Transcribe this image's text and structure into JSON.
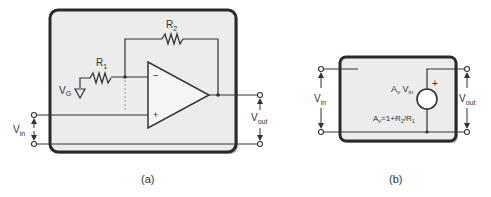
{
  "diagram_a": {
    "caption": "(a)",
    "labels": {
      "r1": "R",
      "r1_sub": "1",
      "r2": "R",
      "r2_sub": "2",
      "vg": "V",
      "vg_sub": "G",
      "vin": "V",
      "vin_sub": "in",
      "vout": "V",
      "vout_sub": "out",
      "minus": "−",
      "plus": "+"
    }
  },
  "diagram_b": {
    "caption": "(b)",
    "labels": {
      "vin": "V",
      "vin_sub": "in",
      "vout": "V",
      "vout_sub": "out",
      "source_a": "A",
      "source_a_sub": "v",
      "source_v": " V",
      "source_v_sub": "in",
      "gain_a": "A",
      "gain_a_sub": "v",
      "gain_eq": "=1+R",
      "gain_r2_sub": "2",
      "gain_slash": "/R",
      "gain_r1_sub": "1",
      "plus": "+"
    }
  },
  "colors": {
    "box_fill": "#ececec",
    "box_border": "#2a2a2a",
    "wire": "#333333"
  }
}
